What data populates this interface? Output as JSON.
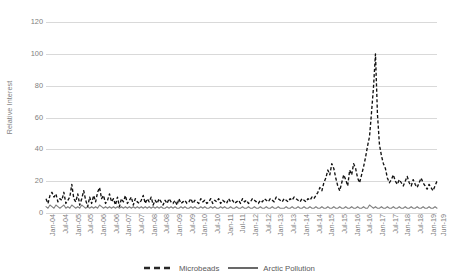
{
  "chart_data": {
    "type": "line",
    "title": "",
    "xlabel": "",
    "ylabel": "Relative Interest",
    "ylim": [
      0,
      120
    ],
    "yticks": [
      0,
      20,
      40,
      60,
      80,
      100,
      120
    ],
    "grid": true,
    "legend_position": "bottom-center",
    "x_tick_labels": [
      "Jan-04",
      "Jul-04",
      "Jan-05",
      "Jul-05",
      "Jan-06",
      "Jul-06",
      "Jan-07",
      "Jul-07",
      "Jan-08",
      "Jul-08",
      "Jan-09",
      "Jul-09",
      "Jan-10",
      "Jul-10",
      "Jan-11",
      "Jul-11",
      "Jan-12",
      "Jul-12",
      "Jan-13",
      "Jul-13",
      "Jan-14",
      "Jul-14",
      "Jan-15",
      "Jul-15",
      "Jan-16",
      "Jul-16",
      "Jan-17",
      "Jul-17",
      "Jan-18",
      "Jul-18",
      "Jan-19",
      "Jun-19"
    ],
    "x_start": "Jan-04",
    "x_end": "Jun-19",
    "n_points": 186,
    "series": [
      {
        "name": "Microbeads",
        "style": "dashed",
        "color": "#000000",
        "values": [
          9,
          6,
          11,
          13,
          10,
          12,
          7,
          9,
          8,
          13,
          6,
          8,
          10,
          18,
          9,
          7,
          12,
          5,
          9,
          14,
          8,
          4,
          10,
          6,
          11,
          7,
          13,
          16,
          9,
          11,
          6,
          8,
          12,
          7,
          9,
          5,
          10,
          4,
          9,
          7,
          11,
          6,
          8,
          10,
          5,
          9,
          7,
          6,
          8,
          11,
          6,
          9,
          7,
          10,
          5,
          8,
          6,
          9,
          7,
          5,
          8,
          6,
          9,
          7,
          6,
          8,
          5,
          9,
          6,
          7,
          8,
          6,
          7,
          9,
          6,
          8,
          7,
          6,
          9,
          7,
          8,
          6,
          7,
          9,
          6,
          8,
          7,
          9,
          6,
          8,
          7,
          6,
          9,
          7,
          8,
          6,
          7,
          8,
          6,
          9,
          7,
          8,
          6,
          7,
          9,
          8,
          7,
          6,
          8,
          7,
          9,
          8,
          7,
          9,
          8,
          7,
          10,
          9,
          8,
          7,
          9,
          8,
          7,
          9,
          8,
          10,
          9,
          8,
          7,
          9,
          8,
          7,
          9,
          8,
          10,
          9,
          11,
          13,
          16,
          14,
          19,
          22,
          27,
          24,
          31,
          28,
          22,
          17,
          14,
          19,
          24,
          21,
          17,
          27,
          24,
          31,
          28,
          22,
          19,
          24,
          29,
          35,
          42,
          48,
          63,
          79,
          100,
          62,
          43,
          36,
          31,
          28,
          22,
          19,
          21,
          24,
          20,
          18,
          21,
          19,
          17,
          20,
          23,
          19,
          17,
          21,
          18,
          16,
          19,
          22,
          19,
          17,
          15,
          18,
          16,
          14,
          17,
          20
        ]
      },
      {
        "name": "Arctic Pollution",
        "style": "solid",
        "color": "#808080",
        "values": [
          4,
          3,
          5,
          4,
          3,
          5,
          4,
          3,
          4,
          5,
          3,
          4,
          3,
          5,
          4,
          3,
          4,
          3,
          5,
          4,
          3,
          4,
          3,
          4,
          3,
          4,
          3,
          5,
          4,
          3,
          4,
          3,
          4,
          3,
          4,
          3,
          4,
          3,
          4,
          3,
          4,
          3,
          4,
          3,
          4,
          3,
          4,
          3,
          4,
          3,
          4,
          3,
          4,
          3,
          4,
          3,
          4,
          3,
          4,
          3,
          3,
          4,
          3,
          4,
          3,
          4,
          3,
          3,
          4,
          3,
          4,
          3,
          3,
          4,
          3,
          4,
          3,
          3,
          4,
          3,
          4,
          3,
          3,
          4,
          3,
          4,
          3,
          3,
          4,
          3,
          4,
          3,
          3,
          4,
          3,
          3,
          4,
          3,
          3,
          4,
          3,
          3,
          4,
          3,
          3,
          4,
          3,
          3,
          4,
          3,
          3,
          4,
          3,
          3,
          4,
          3,
          3,
          4,
          3,
          3,
          3,
          4,
          3,
          3,
          4,
          3,
          3,
          4,
          3,
          3,
          4,
          3,
          3,
          4,
          3,
          3,
          4,
          3,
          3,
          4,
          3,
          3,
          4,
          3,
          3,
          4,
          3,
          3,
          4,
          3,
          3,
          4,
          3,
          3,
          4,
          3,
          3,
          4,
          3,
          3,
          4,
          3,
          3,
          5,
          4,
          3,
          4,
          3,
          3,
          4,
          3,
          3,
          4,
          3,
          3,
          4,
          3,
          3,
          4,
          3,
          3,
          4,
          3,
          3,
          4,
          3,
          3,
          4,
          3,
          3,
          4,
          3,
          3,
          4,
          3,
          3,
          4,
          3
        ]
      }
    ]
  },
  "legend": {
    "entries": [
      {
        "label": "Microbeads"
      },
      {
        "label": "Arctic Pollution"
      }
    ]
  }
}
